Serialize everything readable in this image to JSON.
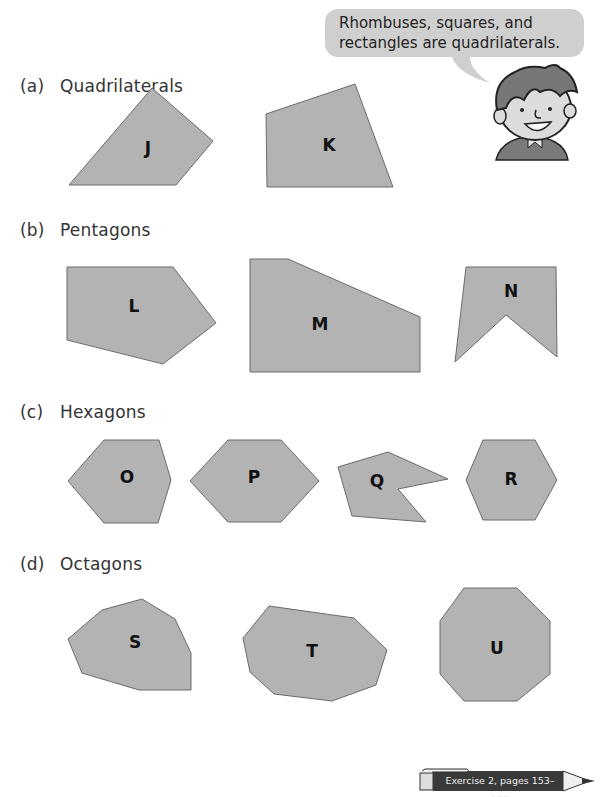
{
  "speech_bubble": {
    "line1": "Rhombuses, squares, and",
    "line2": "rectangles are quadrilaterals."
  },
  "sections": [
    {
      "label": "(a)",
      "title": "Quadrilaterals"
    },
    {
      "label": "(b)",
      "title": "Pentagons"
    },
    {
      "label": "(c)",
      "title": "Hexagons"
    },
    {
      "label": "(d)",
      "title": "Octagons"
    }
  ],
  "shapes": {
    "J": "J",
    "K": "K",
    "L": "L",
    "M": "M",
    "N": "N",
    "O": "O",
    "P": "P",
    "Q": "Q",
    "R": "R",
    "S": "S",
    "T": "T",
    "U": "U"
  },
  "colors": {
    "shape_fill": "#b3b3b3",
    "shape_stroke": "#6b6b6b",
    "bubble": "#cfcfcf",
    "pencil_body": "#3a3a3a"
  },
  "footer": {
    "exercise_ref": "Exercise 2, pages 153–155"
  }
}
